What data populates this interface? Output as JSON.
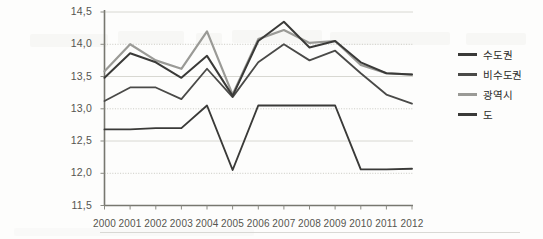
{
  "chart_data": {
    "type": "line",
    "title": "",
    "subtitle": "",
    "xlabel": "",
    "ylabel": "",
    "grid": true,
    "legend_position": "right",
    "decimal_separator": ",",
    "x": [
      2000,
      2001,
      2002,
      2003,
      2004,
      2005,
      2006,
      2007,
      2008,
      2009,
      2010,
      2011,
      2012
    ],
    "categories": [
      "2000",
      "2001",
      "2002",
      "2003",
      "2004",
      "2005",
      "2006",
      "2007",
      "2008",
      "2009",
      "2010",
      "2011",
      "2012"
    ],
    "xtick_labels": [
      "2000",
      "2001",
      "2002",
      "2003",
      "2004",
      "2005",
      "2006",
      "2007",
      "2008",
      "2009",
      "2010",
      "2011",
      "2012"
    ],
    "ytick_labels": [
      "11,5",
      "12,0",
      "12,5",
      "13,0",
      "13,5",
      "14,0",
      "14,5"
    ],
    "ytick_values": [
      11.5,
      12.0,
      12.5,
      13.0,
      13.5,
      14.0,
      14.5
    ],
    "ylim": [
      11.5,
      14.5
    ],
    "xlim": [
      2000,
      2012
    ],
    "series": [
      {
        "name": "수도권",
        "color": "#3a3a38",
        "width": 2.0,
        "values": [
          13.48,
          13.86,
          13.72,
          13.48,
          13.82,
          13.2,
          14.05,
          14.35,
          13.95,
          14.05,
          13.72,
          13.55,
          13.53
        ]
      },
      {
        "name": "비수도권",
        "color": "#4a4a48",
        "width": 1.8,
        "values": [
          13.12,
          13.33,
          13.33,
          13.15,
          13.62,
          13.18,
          13.72,
          14.0,
          13.75,
          13.9,
          13.55,
          13.22,
          13.08
        ]
      },
      {
        "name": "광역시",
        "color": "#9a9a96",
        "width": 2.2,
        "values": [
          13.58,
          14.0,
          13.75,
          13.62,
          14.2,
          13.22,
          14.08,
          14.22,
          14.02,
          14.05,
          13.68,
          13.55,
          13.53
        ]
      },
      {
        "name": "도",
        "color": "#3a3a38",
        "width": 1.9,
        "values": [
          12.68,
          12.68,
          12.7,
          12.7,
          13.05,
          12.05,
          13.05,
          13.05,
          13.05,
          13.05,
          12.06,
          12.06,
          12.07
        ]
      }
    ]
  },
  "legend": {
    "items": [
      {
        "label": "수도권",
        "color": "#3a3a38"
      },
      {
        "label": "비수도권",
        "color": "#4a4a48"
      },
      {
        "label": "광역시",
        "color": "#9a9a96"
      },
      {
        "label": "도",
        "color": "#3a3a38"
      }
    ]
  }
}
